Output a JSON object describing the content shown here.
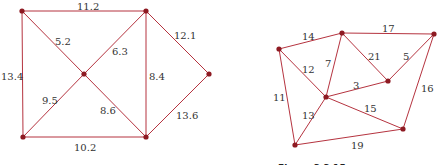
{
  "graphs": [
    {
      "name": "left-graph",
      "nodes": [
        {
          "id": "TL",
          "x": 22,
          "y": 11
        },
        {
          "id": "TR",
          "x": 146,
          "y": 11
        },
        {
          "id": "C",
          "x": 84,
          "y": 74
        },
        {
          "id": "R",
          "x": 209,
          "y": 74
        },
        {
          "id": "BL",
          "x": 23,
          "y": 137
        },
        {
          "id": "BR",
          "x": 146,
          "y": 137
        }
      ],
      "edges": [
        {
          "from": "TL",
          "to": "TR",
          "weight": "11.2",
          "lx": 77,
          "ly": 10
        },
        {
          "from": "TL",
          "to": "C",
          "weight": "5.2",
          "lx": 55,
          "ly": 45
        },
        {
          "from": "TR",
          "to": "C",
          "weight": "6.3",
          "lx": 112,
          "ly": 55
        },
        {
          "from": "TR",
          "to": "R",
          "weight": "12.1",
          "lx": 174,
          "ly": 39
        },
        {
          "from": "TL",
          "to": "BL",
          "weight": "13.4",
          "lx": 1,
          "ly": 80
        },
        {
          "from": "TR",
          "to": "BR",
          "weight": "8.4",
          "lx": 149,
          "ly": 80
        },
        {
          "from": "C",
          "to": "BL",
          "weight": "9.5",
          "lx": 42,
          "ly": 104
        },
        {
          "from": "C",
          "to": "BR",
          "weight": "8.6",
          "lx": 100,
          "ly": 114
        },
        {
          "from": "R",
          "to": "BR",
          "weight": "13.6",
          "lx": 176,
          "ly": 119
        },
        {
          "from": "BL",
          "to": "BR",
          "weight": "10.2",
          "lx": 74,
          "ly": 151
        }
      ]
    },
    {
      "name": "right-graph",
      "nodes": [
        {
          "id": "A",
          "x": 279,
          "y": 49
        },
        {
          "id": "B",
          "x": 342,
          "y": 33
        },
        {
          "id": "C",
          "x": 434,
          "y": 34
        },
        {
          "id": "D",
          "x": 388,
          "y": 81
        },
        {
          "id": "E",
          "x": 326,
          "y": 97
        },
        {
          "id": "F",
          "x": 403,
          "y": 129
        },
        {
          "id": "G",
          "x": 295,
          "y": 145
        }
      ],
      "edges": [
        {
          "from": "A",
          "to": "B",
          "weight": "14",
          "lx": 302,
          "ly": 40
        },
        {
          "from": "B",
          "to": "C",
          "weight": "17",
          "lx": 382,
          "ly": 32
        },
        {
          "from": "A",
          "to": "E",
          "weight": "12",
          "lx": 302,
          "ly": 73
        },
        {
          "from": "B",
          "to": "E",
          "weight": "7",
          "lx": 325,
          "ly": 67
        },
        {
          "from": "B",
          "to": "D",
          "weight": "21",
          "lx": 368,
          "ly": 60
        },
        {
          "from": "D",
          "to": "C",
          "weight": "5",
          "lx": 403,
          "ly": 60
        },
        {
          "from": "E",
          "to": "D",
          "weight": "3",
          "lx": 353,
          "ly": 89
        },
        {
          "from": "C",
          "to": "F",
          "weight": "16",
          "lx": 421,
          "ly": 92
        },
        {
          "from": "A",
          "to": "G",
          "weight": "11",
          "lx": 273,
          "ly": 101
        },
        {
          "from": "E",
          "to": "G",
          "weight": "13",
          "lx": 302,
          "ly": 119
        },
        {
          "from": "E",
          "to": "F",
          "weight": "15",
          "lx": 364,
          "ly": 112
        },
        {
          "from": "G",
          "to": "F",
          "weight": "19",
          "lx": 351,
          "ly": 149
        }
      ]
    }
  ],
  "captions": {
    "right": "Figure 2.2.15"
  },
  "colors": {
    "edge": "#b5333f",
    "node": "#8e1a22",
    "label": "#333333"
  }
}
